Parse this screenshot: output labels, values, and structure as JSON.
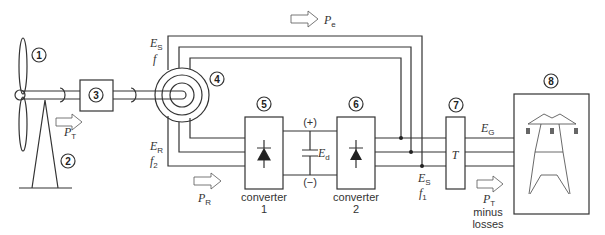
{
  "diagram": {
    "components": [
      {
        "id": "1",
        "label": "1",
        "name": "rotor blades"
      },
      {
        "id": "2",
        "label": "2",
        "name": "tower"
      },
      {
        "id": "3",
        "label": "3",
        "name": "gearbox"
      },
      {
        "id": "4",
        "label": "4",
        "name": "induction generator"
      },
      {
        "id": "5",
        "label": "5",
        "name": "converter 1"
      },
      {
        "id": "6",
        "label": "6",
        "name": "converter 2"
      },
      {
        "id": "7",
        "label": "7",
        "name": "transformer"
      },
      {
        "id": "8",
        "label": "8",
        "name": "grid"
      }
    ],
    "labels": {
      "pt_main": "P",
      "pt_sub": "T",
      "pe_main": "P",
      "pe_sub": "e",
      "pr_main": "P",
      "pr_sub": "R",
      "pt2_main": "P",
      "pt2_sub": "T",
      "minus": "minus",
      "losses": "losses",
      "es_top_main": "E",
      "es_top_sub": "S",
      "f_top": "f",
      "er_main": "E",
      "er_sub": "R",
      "f2_main": "f",
      "f2_sub": "2",
      "ed_main": "E",
      "ed_sub": "d",
      "plus": "(+)",
      "minus_sign": "(−)",
      "es_bot_main": "E",
      "es_bot_sub": "S",
      "f1_main": "f",
      "f1_sub": "1",
      "eg_main": "E",
      "eg_sub": "G",
      "transformer": "T",
      "converter1_line1": "converter",
      "converter1_line2": "1",
      "converter2_line1": "converter",
      "converter2_line2": "2"
    }
  }
}
